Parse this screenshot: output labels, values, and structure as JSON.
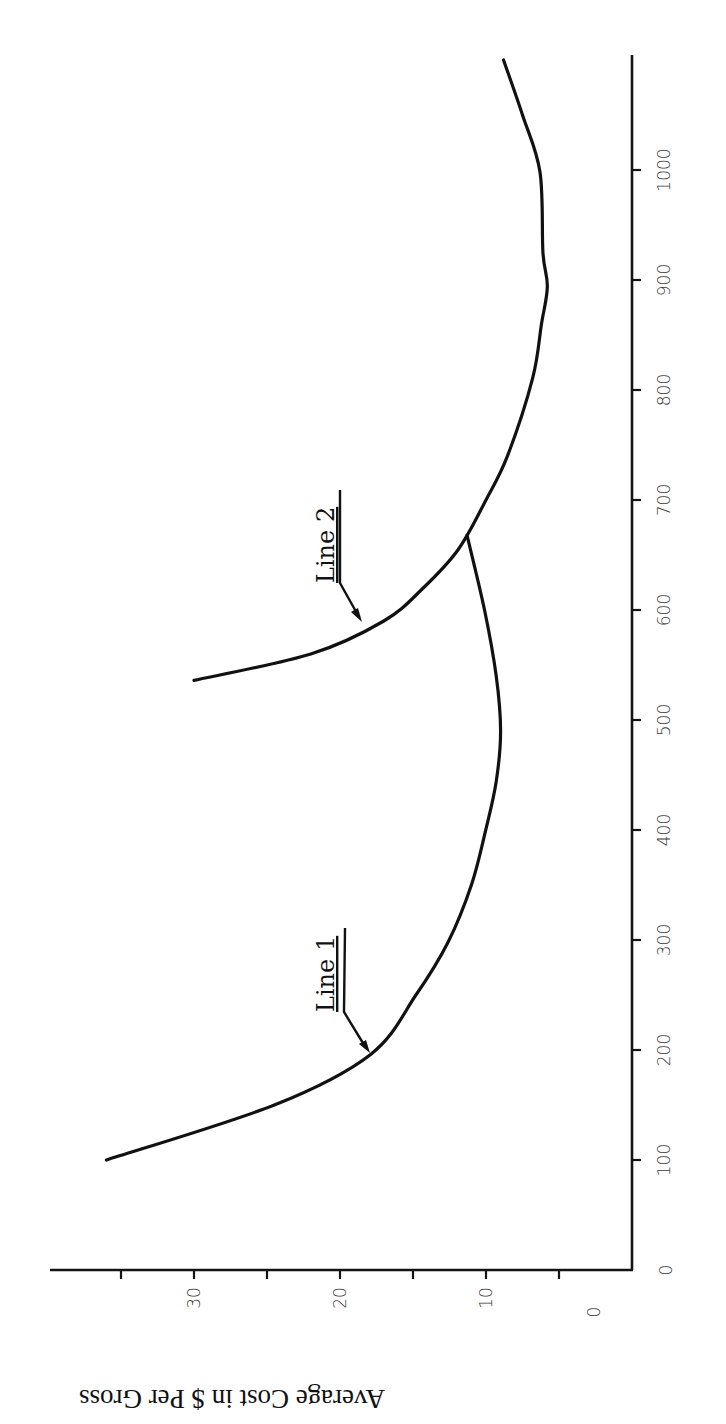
{
  "chart_data": {
    "type": "line",
    "title": "",
    "xlabel": "",
    "ylabel": "Average Cost in $ Per Gross",
    "orientation_note": "figure rotated 90 degrees counter-clockwise on page",
    "xlim": [
      0,
      1100
    ],
    "ylim": [
      0,
      37
    ],
    "x_ticks": [
      0,
      100,
      200,
      300,
      400,
      500,
      600,
      700,
      800,
      900,
      1000
    ],
    "y_ticks": [
      0,
      10,
      20,
      30
    ],
    "y_minor_ticks": [
      5,
      15,
      25,
      35
    ],
    "grid": false,
    "legend": null,
    "series": [
      {
        "name": "Line 1",
        "points": [
          [
            100,
            36.0
          ],
          [
            150,
            24.5
          ],
          [
            196,
            17.9
          ],
          [
            250,
            14.8
          ],
          [
            298,
            12.6
          ],
          [
            350,
            11.0
          ],
          [
            401,
            10.0
          ],
          [
            444,
            9.3
          ],
          [
            490,
            9.0
          ],
          [
            540,
            9.3
          ],
          [
            600,
            10.1
          ],
          [
            668,
            11.3
          ]
        ]
      },
      {
        "name": "Line 2",
        "points": [
          [
            536,
            30.0
          ],
          [
            560,
            22.0
          ],
          [
            590,
            17.0
          ],
          [
            620,
            14.3
          ],
          [
            655,
            11.9
          ],
          [
            700,
            10.0
          ],
          [
            741,
            8.5
          ],
          [
            811,
            6.8
          ],
          [
            860,
            6.2
          ],
          [
            894,
            5.8
          ],
          [
            925,
            6.1
          ],
          [
            998,
            6.3
          ],
          [
            1050,
            7.5
          ],
          [
            1100,
            8.8
          ]
        ]
      }
    ],
    "annotations": [
      {
        "text": "Line 1",
        "points_to": [
          196,
          17.9
        ]
      },
      {
        "text": "Line 2",
        "points_to": [
          590,
          17.0
        ]
      }
    ]
  },
  "labels": {
    "ylabel": "Average Cost in $ Per Gross",
    "line1": "Line 1",
    "line2": "Line 2",
    "xtick_0": "0",
    "xtick_100": "100",
    "xtick_200": "200",
    "xtick_300": "300",
    "xtick_400": "400",
    "xtick_500": "500",
    "xtick_600": "600",
    "xtick_700": "700",
    "xtick_800": "800",
    "xtick_900": "900",
    "xtick_1000": "1000",
    "ytick_0": "0",
    "ytick_10": "10",
    "ytick_20": "20",
    "ytick_30": "30"
  }
}
